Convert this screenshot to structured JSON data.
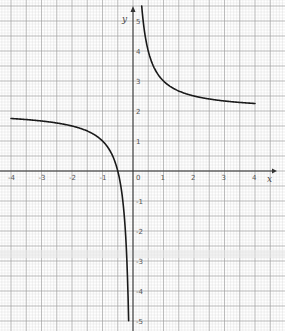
{
  "chart_data": {
    "type": "line",
    "title": "",
    "xlabel": "x",
    "ylabel": "y",
    "xlim": [
      -4,
      4.5
    ],
    "ylim": [
      -5,
      5.5
    ],
    "grid": true,
    "legend": null,
    "x_ticks": [
      -4,
      -3,
      -2,
      -1,
      0,
      1,
      2,
      3,
      4
    ],
    "x_tick_labels": [
      "-4",
      "-3",
      "-2",
      "-1",
      "0",
      "1",
      "2",
      "3",
      "4"
    ],
    "y_ticks": [
      -5,
      -4,
      -3,
      -2,
      -1,
      1,
      2,
      3,
      4,
      5
    ],
    "y_tick_labels": [
      "-5",
      "-4",
      "-3",
      "-2",
      "-1",
      "1",
      "2",
      "3",
      "4",
      "5"
    ],
    "series": [
      {
        "name": "left branch (x<0)",
        "function": "y = 2 + 1/x",
        "x": [
          -4,
          -3,
          -2,
          -1.5,
          -1,
          -0.75,
          -0.5,
          -0.4,
          -0.3,
          -0.25,
          -0.2,
          -0.167,
          -0.143
        ],
        "y": [
          1.75,
          1.67,
          1.5,
          1.33,
          1.0,
          0.67,
          0.0,
          -0.5,
          -1.33,
          -2.0,
          -3.0,
          -4.0,
          -5.0
        ]
      },
      {
        "name": "right branch (x>0)",
        "function": "y = 2 + 1/x",
        "x": [
          0.286,
          0.333,
          0.4,
          0.5,
          0.667,
          0.75,
          1,
          1.5,
          2,
          2.5,
          3,
          3.5,
          4
        ],
        "y": [
          5.5,
          5.0,
          4.5,
          4.0,
          3.5,
          3.33,
          3.0,
          2.67,
          2.5,
          2.4,
          2.33,
          2.29,
          2.25
        ]
      }
    ],
    "asymptotes": {
      "vertical": 0,
      "horizontal": 2
    }
  },
  "axes": {
    "x_label": "x",
    "y_label": "y",
    "origin_label": "0"
  },
  "colors": {
    "curve": "#1a1a1a",
    "axis": "#333333",
    "major_grid": "#9a9a9a",
    "minor_grid": "#dcdcdc",
    "background": "#ffffff"
  }
}
